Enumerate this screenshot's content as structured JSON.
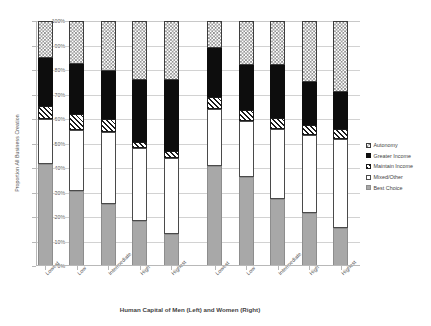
{
  "chart_data": {
    "type": "bar",
    "subtype": "stacked-100-percent",
    "title": "",
    "xlabel": "Human Capital of Men (Left) and Women (Right)",
    "ylabel": "Proportion All Business Creation",
    "ylim": [
      0,
      100
    ],
    "ytick_labels": [
      "100%",
      "90%",
      "80%",
      "70%",
      "60%",
      "50%",
      "40%",
      "30%",
      "20%",
      "10%",
      "0%"
    ],
    "ytick_values": [
      100,
      90,
      80,
      70,
      60,
      50,
      40,
      30,
      20,
      10,
      0
    ],
    "grid": true,
    "legend_position": "right",
    "groups": [
      {
        "name": "Men",
        "side": "Left"
      },
      {
        "name": "Women",
        "side": "Right"
      }
    ],
    "categories": [
      "Lowest",
      "Low",
      "Intermediate",
      "High",
      "Highest",
      "Lowest",
      "Low",
      "Intermediate",
      "High",
      "Highest"
    ],
    "series": [
      {
        "name": "Best Choice",
        "pattern": "solid-gray",
        "color": "#a8a8a8",
        "values": [
          41.5,
          30.5,
          25.5,
          18.5,
          13.0,
          41.0,
          36.5,
          27.5,
          21.5,
          15.5
        ]
      },
      {
        "name": "Mixed/Other",
        "pattern": "solid-white",
        "color": "#ffffff",
        "values": [
          18.5,
          25.0,
          29.0,
          29.5,
          31.0,
          23.0,
          22.5,
          28.5,
          32.0,
          36.5
        ]
      },
      {
        "name": "Maintain Income",
        "pattern": "diagonal-hatch",
        "color": "#1a1a1a",
        "values": [
          5.5,
          6.5,
          5.5,
          2.5,
          3.0,
          5.0,
          4.5,
          4.5,
          4.0,
          4.0
        ]
      },
      {
        "name": "Greater Income",
        "pattern": "solid-black",
        "color": "#0d0d0d",
        "values": [
          19.5,
          20.5,
          19.5,
          25.5,
          29.0,
          20.0,
          18.5,
          21.5,
          17.5,
          15.0
        ]
      },
      {
        "name": "Autonomy",
        "pattern": "checkerboard",
        "color": "#8a8a8a",
        "values": [
          15.0,
          17.5,
          20.5,
          24.0,
          24.0,
          11.0,
          18.0,
          18.0,
          25.0,
          29.0
        ]
      }
    ],
    "legend_entries": [
      {
        "label": "Autonomy",
        "pattern": "checkerboard"
      },
      {
        "label": "Greater Income",
        "pattern": "solid-black"
      },
      {
        "label": "Maintain Income",
        "pattern": "diagonal-hatch"
      },
      {
        "label": "Mixed/Other",
        "pattern": "solid-white"
      },
      {
        "label": "Best Choice",
        "pattern": "solid-gray"
      }
    ]
  }
}
